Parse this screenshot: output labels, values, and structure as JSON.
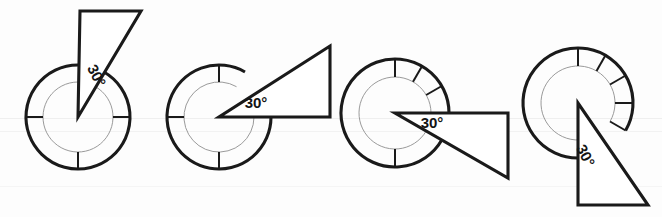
{
  "figure": {
    "background_color": "#fdfdfd",
    "ink_color": "#1a1a1a",
    "guide_color": "#8f8f8f",
    "stage_count": 4,
    "stages": [
      {
        "id": "stage-1",
        "index": 1,
        "angle_label": "30°",
        "label_rotation_deg": 62,
        "label_x": 92,
        "label_y": 78,
        "center_x": 78,
        "center_y": 117,
        "outer_radius": 52,
        "inner_radius": 35,
        "ring_gap_start_deg": 60,
        "ring_gap_end_deg": 90,
        "ticks_deg": [
          0,
          180,
          270
        ],
        "apex_x": 78,
        "apex_y": 117,
        "tri_p2_x": 80,
        "tri_p2_y": 11,
        "tri_p3_x": 141,
        "tri_p3_y": 11,
        "wedge_orientation": "up"
      },
      {
        "id": "stage-2",
        "index": 2,
        "angle_label": "30°",
        "label_rotation_deg": 0,
        "label_x": 256,
        "label_y": 108,
        "center_x": 219,
        "center_y": 117,
        "outer_radius": 52,
        "inner_radius": 35,
        "ring_gap_start_deg": 0,
        "ring_gap_end_deg": 60,
        "ticks_deg": [
          90,
          180,
          270
        ],
        "apex_x": 219,
        "apex_y": 117,
        "tri_p2_x": 330,
        "tri_p2_y": 117,
        "tri_p3_x": 330,
        "tri_p3_y": 46,
        "wedge_orientation": "right-up"
      },
      {
        "id": "stage-3",
        "index": 3,
        "angle_label": "30°",
        "label_rotation_deg": 0,
        "label_x": 432,
        "label_y": 128,
        "center_x": 395,
        "center_y": 113,
        "outer_radius": 54,
        "inner_radius": 36,
        "ring_gap_start_deg": -30,
        "ring_gap_end_deg": 0,
        "ticks_deg": [
          90,
          60,
          30,
          0,
          270
        ],
        "apex_x": 395,
        "apex_y": 113,
        "tri_p2_x": 508,
        "tri_p2_y": 113,
        "tri_p3_x": 508,
        "tri_p3_y": 178,
        "wedge_orientation": "right-down"
      },
      {
        "id": "stage-4",
        "index": 4,
        "angle_label": "30°",
        "label_rotation_deg": 62,
        "label_x": 581,
        "label_y": 158,
        "center_x": 578,
        "center_y": 103,
        "outer_radius": 55,
        "inner_radius": 37,
        "ring_gap_start_deg": -60,
        "ring_gap_end_deg": -30,
        "ticks_deg": [
          90,
          60,
          30,
          0,
          330
        ],
        "apex_x": 578,
        "apex_y": 103,
        "tri_p2_x": 578,
        "tri_p2_y": 205,
        "tri_p3_x": 648,
        "tri_p3_y": 205,
        "wedge_orientation": "down"
      }
    ]
  }
}
